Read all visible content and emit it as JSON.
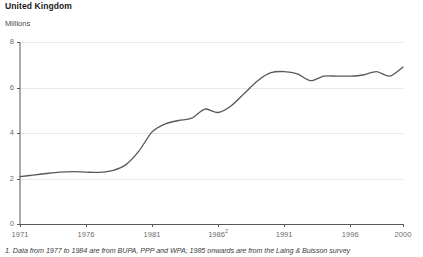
{
  "chart_data": {
    "type": "line",
    "title": "United Kingdom",
    "subtitle": "Millions",
    "ylabel": "Millions",
    "xlabel": "",
    "ylim": [
      0,
      8
    ],
    "xlim": [
      1971,
      2000
    ],
    "grid": true,
    "legend": null,
    "yticks": [
      "0",
      "2",
      "4",
      "6",
      "8"
    ],
    "ytick_values": [
      0,
      2,
      4,
      6,
      8
    ],
    "xticks": [
      "1971",
      "1976",
      "1981",
      "1986",
      "1991",
      "1996",
      "2000"
    ],
    "xtick_values": [
      1971,
      1976,
      1981,
      1986,
      1991,
      1996,
      2000
    ],
    "xtick_superscripts": [
      "",
      "",
      "",
      "2",
      "",
      "",
      ""
    ],
    "line_color": "#58595b",
    "x": [
      1971,
      1972,
      1973,
      1974,
      1975,
      1976,
      1977,
      1978,
      1979,
      1980,
      1981,
      1982,
      1983,
      1984,
      1985,
      1986,
      1987,
      1988,
      1989,
      1990,
      1991,
      1992,
      1993,
      1994,
      1995,
      1996,
      1997,
      1998,
      1999,
      2000
    ],
    "values": [
      2.08,
      2.15,
      2.22,
      2.28,
      2.3,
      2.28,
      2.27,
      2.35,
      2.6,
      3.2,
      4.05,
      4.4,
      4.55,
      4.65,
      5.05,
      4.9,
      5.2,
      5.75,
      6.3,
      6.65,
      6.7,
      6.6,
      6.3,
      6.5,
      6.5,
      6.5,
      6.55,
      6.7,
      6.5,
      6.9
    ],
    "annotations": [],
    "footnote": "1. Data from 1977 to 1984 are from BUPA, PPP and WPA; 1985 onwards are from the Laing & Buisson survey"
  }
}
